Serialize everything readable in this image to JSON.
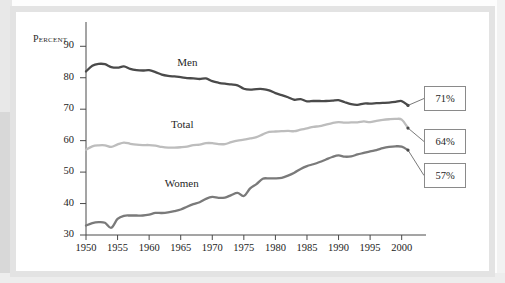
{
  "figure": {
    "axis_title": "Percent",
    "series_labels": {
      "men": "Men",
      "total": "Total",
      "women": "Women"
    },
    "callouts": [
      {
        "name": "men-callout",
        "value": "71%"
      },
      {
        "name": "total-callout",
        "value": "64%"
      },
      {
        "name": "women-callout",
        "value": "57%"
      }
    ]
  },
  "chart_data": {
    "type": "line",
    "title": "",
    "subtitle": "",
    "xlabel": "",
    "ylabel": "Percent",
    "xlim": [
      1950,
      2001
    ],
    "ylim": [
      30,
      92
    ],
    "yticks": [
      30,
      40,
      50,
      60,
      70,
      80,
      90
    ],
    "xticks": [
      1950,
      1955,
      1960,
      1965,
      1970,
      1975,
      1980,
      1985,
      1990,
      1995,
      2000
    ],
    "grid": false,
    "legend": "inline-labels",
    "annotations": [
      {
        "series": "Men",
        "text": "71%",
        "at_x": 2001,
        "at_y": 71
      },
      {
        "series": "Total",
        "text": "64%",
        "at_x": 2001,
        "at_y": 64
      },
      {
        "series": "Women",
        "text": "57%",
        "at_x": 2001,
        "at_y": 57
      }
    ],
    "x": [
      1950,
      1951,
      1952,
      1953,
      1954,
      1955,
      1956,
      1957,
      1958,
      1959,
      1960,
      1961,
      1962,
      1963,
      1964,
      1965,
      1966,
      1967,
      1968,
      1969,
      1970,
      1971,
      1972,
      1973,
      1974,
      1975,
      1976,
      1977,
      1978,
      1979,
      1980,
      1981,
      1982,
      1983,
      1984,
      1985,
      1986,
      1987,
      1988,
      1989,
      1990,
      1991,
      1992,
      1993,
      1994,
      1995,
      1996,
      1997,
      1998,
      1999,
      2000,
      2001
    ],
    "series": [
      {
        "name": "Men",
        "color": "#4a4a4a",
        "values": [
          82.0,
          83.8,
          84.4,
          84.3,
          83.4,
          83.2,
          83.6,
          82.8,
          82.4,
          82.3,
          82.4,
          81.8,
          81.0,
          80.6,
          80.4,
          80.2,
          79.9,
          79.8,
          79.6,
          79.8,
          78.9,
          78.4,
          78.1,
          77.9,
          77.6,
          76.5,
          76.2,
          76.4,
          76.4,
          76.0,
          75.1,
          74.5,
          73.8,
          73.0,
          73.2,
          72.5,
          72.6,
          72.6,
          72.6,
          72.7,
          72.9,
          72.2,
          71.6,
          71.4,
          71.8,
          71.8,
          71.9,
          72.0,
          72.1,
          72.3,
          72.6,
          71.2
        ]
      },
      {
        "name": "Total",
        "color": "#bdbdbd",
        "values": [
          57.1,
          58.2,
          58.5,
          58.5,
          58.0,
          58.8,
          59.4,
          59.0,
          58.7,
          58.6,
          58.6,
          58.4,
          58.0,
          57.8,
          57.8,
          57.9,
          58.1,
          58.6,
          58.7,
          59.2,
          59.2,
          58.9,
          58.9,
          59.5,
          60.0,
          60.3,
          60.7,
          61.1,
          62.0,
          62.8,
          62.9,
          63.0,
          63.1,
          63.0,
          63.5,
          63.9,
          64.4,
          64.6,
          65.1,
          65.6,
          65.9,
          65.7,
          65.8,
          65.8,
          66.1,
          65.9,
          66.3,
          66.6,
          66.8,
          66.9,
          66.7,
          64.0
        ]
      },
      {
        "name": "Women",
        "color": "#7a7a7a",
        "values": [
          33.0,
          33.8,
          34.1,
          33.9,
          32.3,
          35.1,
          36.1,
          36.2,
          36.2,
          36.2,
          36.5,
          37.0,
          37.0,
          37.2,
          37.6,
          38.1,
          39.0,
          39.8,
          40.4,
          41.5,
          42.1,
          41.8,
          41.9,
          42.7,
          43.4,
          42.4,
          44.8,
          46.2,
          47.9,
          48.0,
          48.0,
          48.2,
          48.9,
          49.8,
          51.0,
          51.9,
          52.5,
          53.2,
          54.0,
          54.8,
          55.3,
          54.9,
          55.0,
          55.6,
          56.1,
          56.6,
          57.0,
          57.6,
          58.0,
          58.2,
          58.1,
          57.0
        ]
      }
    ]
  }
}
